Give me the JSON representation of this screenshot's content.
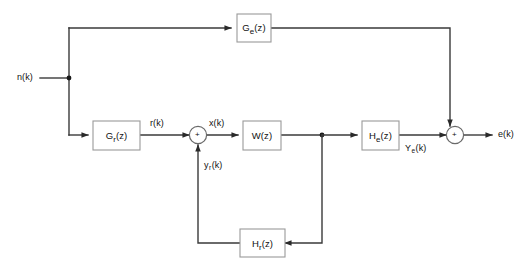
{
  "diagram": {
    "type": "control-system-block-diagram",
    "background_color": "#ffffff",
    "line_color": "#3a3a3a",
    "block_border_color": "#9a9a9a",
    "text_color": "#111111",
    "blocks": [
      {
        "id": "ge",
        "base": "G",
        "sub": "e",
        "suffix": "(z)",
        "full": "G e(z)"
      },
      {
        "id": "gr",
        "base": "G",
        "sub": "r",
        "suffix": "(z)",
        "full": "G r(z)"
      },
      {
        "id": "w",
        "base": "W",
        "sub": "",
        "suffix": "(z)",
        "full": "W(z)"
      },
      {
        "id": "he",
        "base": "H",
        "sub": "e",
        "suffix": "(z)",
        "full": "H e(z)"
      },
      {
        "id": "hr",
        "base": "H",
        "sub": "r",
        "suffix": "(z)",
        "full": "H r(z)"
      }
    ],
    "signals": [
      {
        "id": "nk",
        "base": "n",
        "sub": "",
        "suffix": "(k)",
        "full": "n(k)"
      },
      {
        "id": "rk",
        "base": "r",
        "sub": "",
        "suffix": "(k)",
        "full": "r(k)"
      },
      {
        "id": "xk",
        "base": "x",
        "sub": "",
        "suffix": "(k)",
        "full": "x(k)"
      },
      {
        "id": "yrk",
        "base": "y",
        "sub": "r",
        "suffix": "(k)",
        "full": "y r(k)"
      },
      {
        "id": "yek",
        "base": "Y",
        "sub": "e",
        "suffix": "(k)",
        "full": "Y e(k)"
      },
      {
        "id": "ek",
        "base": "e",
        "sub": "",
        "suffix": "(k)",
        "full": "e(k)"
      }
    ],
    "summing_junctions": [
      {
        "id": "sum-input",
        "sign": "+"
      },
      {
        "id": "sum-output",
        "sign": "+"
      }
    ]
  }
}
